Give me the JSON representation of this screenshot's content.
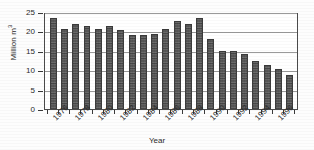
{
  "chart_data": {
    "type": "bar",
    "title": "",
    "xlabel": "Year",
    "ylabel": "Million m³",
    "ylabel_text": "Million m",
    "ylabel_exponent": "3",
    "ylim": [
      0,
      25
    ],
    "yticks": [
      0,
      5,
      10,
      15,
      20,
      25
    ],
    "ytick_labels": [
      "0",
      "5",
      "10",
      "15",
      "20",
      "25"
    ],
    "grid": true,
    "grid_axis": "y",
    "legend": "none",
    "bar_color": "#585858",
    "categories": [
      "1976",
      "1977",
      "1978",
      "1979",
      "1980",
      "1981",
      "1982",
      "1983",
      "1984",
      "1985",
      "1986",
      "1987",
      "1988",
      "1989",
      "1990",
      "1991",
      "1992",
      "1993",
      "1994",
      "1995",
      "1996",
      "1997"
    ],
    "xtick_labels": [
      "1976",
      "1978",
      "1980",
      "1982",
      "1984",
      "1986",
      "1988",
      "1990",
      "1992",
      "1994",
      "1996"
    ],
    "values": [
      23.5,
      20.5,
      22.0,
      21.5,
      20.6,
      21.4,
      20.4,
      19.0,
      19.2,
      19.4,
      20.6,
      22.6,
      22.0,
      23.5,
      18.0,
      15.0,
      14.9,
      14.1,
      12.3,
      11.3,
      10.3,
      8.8
    ]
  }
}
